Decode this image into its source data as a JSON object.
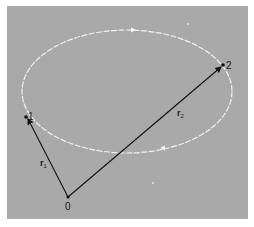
{
  "figure": {
    "background_color": "#a9a9a9",
    "orbit_color": "#f2f2f2",
    "vector_color": "#111111",
    "orbit": {
      "shape": "ellipse",
      "direction_arrows": [
        "top-pointing-right",
        "bottom-pointing-left"
      ]
    },
    "points": [
      {
        "label": "1",
        "role": "position-1"
      },
      {
        "label": "2",
        "role": "position-2"
      },
      {
        "label": "0",
        "role": "origin"
      }
    ],
    "vectors": [
      {
        "symbol": "r",
        "subscript": "1",
        "from": "0",
        "to": "1"
      },
      {
        "symbol": "r",
        "subscript": "2",
        "from": "0",
        "to": "2"
      }
    ]
  }
}
